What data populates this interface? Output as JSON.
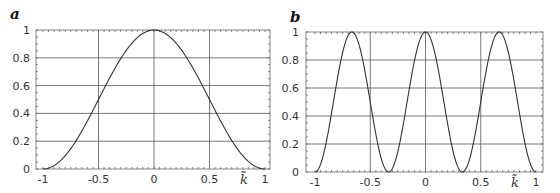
{
  "chart_data": [
    {
      "type": "line",
      "panel_label": "a",
      "xlabel": "k̃",
      "ylabel": "",
      "xlim": [
        -1,
        1
      ],
      "ylim": [
        0,
        1
      ],
      "grid": true,
      "xticks": [
        "-1",
        "-0.5",
        "0",
        "0.5",
        "1"
      ],
      "yticks": [
        "0",
        "0.2",
        "0.4",
        "0.6",
        "0.8",
        "1"
      ],
      "function": "cos^2(pi*k/2)",
      "x": [
        -1,
        -0.75,
        -0.5,
        -0.25,
        0,
        0.25,
        0.5,
        0.75,
        1
      ],
      "y": [
        0,
        0.15,
        0.5,
        0.85,
        1,
        0.85,
        0.5,
        0.15,
        0
      ]
    },
    {
      "type": "line",
      "panel_label": "b",
      "xlabel": "k̃",
      "ylabel": "",
      "xlim": [
        -1,
        1
      ],
      "ylim": [
        0,
        1
      ],
      "grid": true,
      "xticks": [
        "-1",
        "-0.5",
        "0",
        "0.5",
        "1"
      ],
      "yticks": [
        "0",
        "0.2",
        "0.4",
        "0.6",
        "0.8",
        "1"
      ],
      "function": "cos^2(3*pi*k/2)",
      "x": [
        -1,
        -0.833,
        -0.667,
        -0.5,
        -0.333,
        -0.167,
        0,
        0.167,
        0.333,
        0.5,
        0.667,
        0.833,
        1
      ],
      "y": [
        0,
        0.5,
        1,
        0.5,
        0,
        0.5,
        1,
        0.5,
        0,
        0.5,
        1,
        0.5,
        0
      ]
    }
  ]
}
